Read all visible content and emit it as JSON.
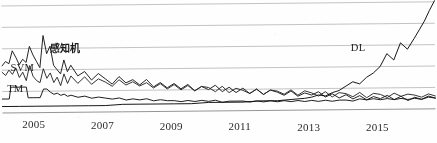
{
  "chart_data": {
    "type": "line",
    "title": "",
    "subtitle": "",
    "xlabel": "",
    "ylabel": "",
    "grid": true,
    "gridlines_y": [
      0,
      20,
      40,
      60,
      80,
      100
    ],
    "legend_position": "inline-on-curves",
    "xlim": [
      2004.0,
      2016.6
    ],
    "ylim": [
      0,
      100
    ],
    "x_tick_labels": [
      "2005",
      "2007",
      "2009",
      "2011",
      "2013",
      "2015"
    ],
    "x_tick_values": [
      2005,
      2007,
      2009,
      2011,
      2013,
      2015
    ],
    "annotations": [
      {
        "text": "感知机",
        "x": 2005.4,
        "y": 62
      },
      {
        "text": "SVM",
        "x": 2004.25,
        "y": 41
      },
      {
        "text": "TM",
        "x": 2004.15,
        "y": 22
      },
      {
        "text": "DL",
        "x": 2014.15,
        "y": 62
      }
    ],
    "series": [
      {
        "name": "感知机",
        "label": "感知机",
        "color": "#1a1a1a",
        "x": [
          2004.0,
          2004.1,
          2004.2,
          2004.3,
          2004.4,
          2004.5,
          2004.6,
          2004.7,
          2004.8,
          2004.9,
          2005.0,
          2005.1,
          2005.2,
          2005.3,
          2005.4,
          2005.5,
          2005.6,
          2005.7,
          2005.8,
          2005.9,
          2006.0,
          2006.2,
          2006.4,
          2006.6,
          2006.8,
          2007.0,
          2007.2,
          2007.4,
          2007.6,
          2007.8,
          2008.0,
          2008.2,
          2008.4,
          2008.6,
          2008.8,
          2009.0,
          2009.2,
          2009.4,
          2009.6,
          2009.8,
          2010.0,
          2010.2,
          2010.4,
          2010.6,
          2010.8,
          2011.0,
          2011.2,
          2011.4,
          2011.6,
          2011.8,
          2012.0,
          2012.2,
          2012.4,
          2012.6,
          2012.8,
          2013.0,
          2013.2,
          2013.4,
          2013.6,
          2013.8,
          2014.0,
          2014.2,
          2014.4,
          2014.6,
          2014.8,
          2015.0,
          2015.2,
          2015.4,
          2015.6,
          2015.8,
          2016.0,
          2016.2,
          2016.4,
          2016.6
        ],
        "values": [
          44,
          48,
          46,
          58,
          52,
          45,
          50,
          47,
          62,
          54,
          48,
          42,
          72,
          55,
          62,
          44,
          40,
          36,
          49,
          38,
          44,
          34,
          38,
          30,
          36,
          31,
          26,
          33,
          27,
          30,
          25,
          30,
          23,
          27,
          22,
          26,
          21,
          25,
          19,
          23,
          20,
          24,
          18,
          22,
          17,
          21,
          16,
          20,
          15,
          19,
          17,
          14,
          18,
          13,
          16,
          14,
          17,
          12,
          15,
          11,
          14,
          10,
          13,
          9,
          12,
          10,
          13,
          9,
          12,
          8,
          11,
          9,
          12,
          10
        ]
      },
      {
        "name": "SVM",
        "label": "SVM",
        "color": "#2a2a2a",
        "x": [
          2004.0,
          2004.1,
          2004.2,
          2004.3,
          2004.4,
          2004.5,
          2004.6,
          2004.7,
          2004.8,
          2004.9,
          2005.0,
          2005.1,
          2005.2,
          2005.3,
          2005.4,
          2005.5,
          2005.6,
          2005.7,
          2005.8,
          2005.9,
          2006.0,
          2006.2,
          2006.4,
          2006.6,
          2006.8,
          2007.0,
          2007.2,
          2007.4,
          2007.6,
          2007.8,
          2008.0,
          2008.2,
          2008.4,
          2008.6,
          2008.8,
          2009.0,
          2009.2,
          2009.4,
          2009.6,
          2009.8,
          2010.0,
          2010.2,
          2010.4,
          2010.6,
          2010.8,
          2011.0,
          2011.2,
          2011.4,
          2011.6,
          2011.8,
          2012.0,
          2012.2,
          2012.4,
          2012.6,
          2012.8,
          2013.0,
          2013.2,
          2013.4,
          2013.6,
          2013.8,
          2014.0,
          2014.2,
          2014.4,
          2014.6,
          2014.8,
          2015.0,
          2015.2,
          2015.4,
          2015.6,
          2015.8,
          2016.0,
          2016.2,
          2016.4,
          2016.6
        ],
        "values": [
          38,
          35,
          40,
          36,
          42,
          33,
          38,
          30,
          44,
          34,
          30,
          28,
          41,
          32,
          37,
          28,
          33,
          25,
          36,
          27,
          34,
          27,
          33,
          26,
          31,
          28,
          24,
          30,
          25,
          28,
          24,
          27,
          22,
          26,
          21,
          25,
          20,
          24,
          19,
          23,
          22,
          18,
          23,
          17,
          21,
          19,
          16,
          20,
          15,
          19,
          18,
          15,
          19,
          14,
          18,
          16,
          13,
          17,
          12,
          16,
          15,
          12,
          16,
          11,
          15,
          14,
          11,
          15,
          12,
          14,
          13,
          11,
          14,
          12
        ]
      },
      {
        "name": "TM",
        "label": "TM",
        "color": "#141414",
        "x": [
          2004.0,
          2004.1,
          2004.2,
          2004.25,
          2004.3,
          2004.4,
          2004.5,
          2004.6,
          2004.7,
          2004.75,
          2004.8,
          2004.9,
          2005.0,
          2005.1,
          2005.2,
          2005.3,
          2005.4,
          2005.5,
          2005.6,
          2005.7,
          2005.8,
          2005.9,
          2006.0,
          2006.2,
          2006.4,
          2006.6,
          2006.8,
          2007.0,
          2007.2,
          2007.4,
          2007.6,
          2007.8,
          2008.0,
          2008.2,
          2008.4,
          2008.6,
          2008.8,
          2009.0,
          2009.2,
          2009.4,
          2009.6,
          2009.8,
          2010.0,
          2010.2,
          2010.4,
          2010.6,
          2010.8,
          2011.0,
          2011.2,
          2011.4,
          2011.6,
          2011.8,
          2012.0,
          2012.2,
          2012.4,
          2012.6,
          2012.8,
          2013.0,
          2013.2,
          2013.4,
          2013.6,
          2013.8,
          2014.0,
          2014.2,
          2014.4,
          2014.6,
          2014.8,
          2015.0,
          2015.2,
          2015.4,
          2015.6,
          2015.8,
          2016.0,
          2016.2,
          2016.4,
          2016.6
        ],
        "values": [
          13,
          13,
          13,
          24,
          24,
          24,
          24,
          24,
          24,
          14,
          14,
          14,
          14,
          14,
          22,
          22,
          19,
          17,
          18,
          16,
          17,
          15,
          16,
          14,
          15,
          13,
          14,
          13,
          12,
          13,
          11,
          12,
          11,
          12,
          10,
          11,
          10,
          10,
          9,
          10,
          9,
          10,
          9,
          10,
          8,
          9,
          9,
          9,
          8,
          9,
          8,
          9,
          8,
          9,
          8,
          9,
          8,
          9,
          8,
          9,
          8,
          9,
          9,
          8,
          10,
          9,
          10,
          9,
          10,
          9,
          10,
          9,
          10,
          9,
          11,
          10
        ]
      },
      {
        "name": "DL",
        "label": "DL",
        "color": "#0d0d0d",
        "x": [
          2004.0,
          2004.5,
          2005.0,
          2005.5,
          2006.0,
          2006.5,
          2007.0,
          2007.5,
          2008.0,
          2008.5,
          2009.0,
          2009.5,
          2010.0,
          2010.5,
          2011.0,
          2011.5,
          2012.0,
          2012.4,
          2012.8,
          2013.0,
          2013.2,
          2013.4,
          2013.6,
          2013.8,
          2014.0,
          2014.2,
          2014.4,
          2014.6,
          2014.8,
          2015.0,
          2015.2,
          2015.4,
          2015.6,
          2015.8,
          2016.0,
          2016.15,
          2016.3,
          2016.45,
          2016.6
        ],
        "values": [
          6,
          6,
          6,
          6,
          6,
          6,
          6,
          7,
          7,
          7,
          7,
          7,
          8,
          8,
          8,
          9,
          9,
          10,
          11,
          12,
          14,
          13,
          16,
          18,
          22,
          26,
          24,
          30,
          34,
          40,
          52,
          46,
          62,
          56,
          66,
          74,
          82,
          92,
          101
        ]
      }
    ]
  }
}
